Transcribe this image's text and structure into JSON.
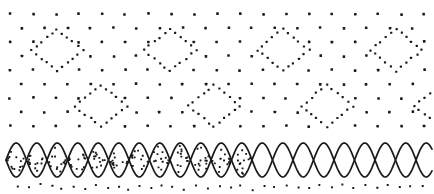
{
  "figure": {
    "title": "Ornamental dotted lattice with diamond motifs and interlaced wave band",
    "width": 434,
    "height": 194,
    "background_color": "#ffffff",
    "ink_color": "#1a1a1a"
  },
  "chart_data": {
    "type": "scatter",
    "title": "Ornamental dotted lattice with diamond motifs and interlaced wave band",
    "subtitle": "",
    "xlabel": "",
    "ylabel": "",
    "xlim": [
      0,
      434
    ],
    "ylim": [
      0,
      194
    ],
    "grid": false,
    "legend_position": "none",
    "annotations": [
      "staggered dot lattice fills the upper field",
      "row of four dotted diamond outlines at upper band",
      "row of four dotted diamond outlines at lower band, offset horizontally",
      "interlaced double sine-wave braid forms dot-filled lens shapes",
      "scattered dot row beneath the braid band"
    ],
    "series": [
      {
        "name": "lattice-dots",
        "marker": "square-dot",
        "marker_size": 2.6,
        "color": "#1a1a1a",
        "row_spacing_y": 14,
        "col_spacing_x": 23,
        "stagger_offset_x": 11.5,
        "x_start": 10,
        "y_start": 14,
        "rows": 9,
        "cols": 19
      },
      {
        "name": "scatter-dots-below-band",
        "marker": "square-dot",
        "marker_size": 2.0,
        "color": "#1a1a1a",
        "x": [
          18,
          30,
          41,
          53,
          62,
          74,
          86,
          95,
          107,
          118,
          128,
          140,
          151,
          162,
          173,
          185,
          196,
          207,
          219,
          230,
          241,
          252,
          264,
          275,
          286,
          298,
          309,
          320,
          331,
          343,
          354,
          365,
          377,
          388,
          399,
          411,
          422
        ],
        "y": [
          186,
          188,
          185,
          187,
          189,
          186,
          188,
          185,
          187,
          186,
          189,
          186,
          188,
          185,
          187,
          189,
          186,
          188,
          185,
          187,
          186,
          189,
          186,
          188,
          185,
          187,
          189,
          186,
          188,
          185,
          187,
          186,
          189,
          186,
          188,
          185,
          187
        ]
      }
    ],
    "diamonds": {
      "marker": "square-dot",
      "marker_size": 2.2,
      "color": "#1a1a1a",
      "dots_per_side": 5,
      "row_upper": {
        "center_y": 50,
        "half_width": 26,
        "half_height": 21,
        "centers_x": [
          57,
          170,
          283,
          396
        ]
      },
      "row_lower": {
        "center_y": 106,
        "half_width": 26,
        "half_height": 21,
        "centers_x": [
          101,
          214,
          327,
          440
        ]
      }
    },
    "wave_band": {
      "center_y": 160,
      "amplitude": 17,
      "period": 41,
      "x_start": 6,
      "x_end": 432,
      "stroke_color": "#1a1a1a",
      "stroke_width": 1.7,
      "lens_count": 11,
      "lens_fill_dots_per_lens": 13,
      "lens_dot_size": 1.9,
      "lens_dot_color": "#1a1a1a"
    }
  }
}
